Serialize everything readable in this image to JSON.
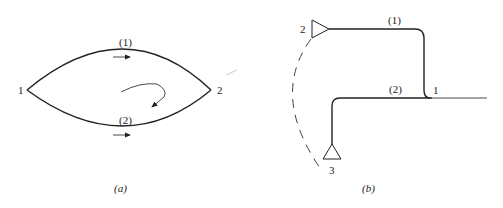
{
  "figure_a": {
    "caption": "(a)",
    "nodes": [
      {
        "id": "node-1",
        "label": "1"
      },
      {
        "id": "node-2",
        "label": "2"
      }
    ],
    "paths": [
      {
        "id": "path-1",
        "label": "(1)",
        "position": "upper arc",
        "flow_direction": "left-to-right"
      },
      {
        "id": "path-2",
        "label": "(2)",
        "position": "lower arc",
        "flow_direction": "left-to-right"
      }
    ],
    "circulation_arrow": "clockwise-curved arrow at center"
  },
  "figure_b": {
    "caption": "(b)",
    "nodes": [
      {
        "id": "node-1",
        "label": "1",
        "role": "junction"
      },
      {
        "id": "node-2",
        "label": "2",
        "role": "triangle terminal pointing right"
      },
      {
        "id": "node-3",
        "label": "3",
        "role": "triangle terminal pointing up"
      }
    ],
    "paths": [
      {
        "id": "path-1",
        "label": "(1)",
        "from": "1",
        "to": "2",
        "route": "up then left"
      },
      {
        "id": "path-2",
        "label": "(2)",
        "from": "1",
        "to": "3",
        "route": "left then down"
      }
    ],
    "dashed_link": "dashed arc connecting terminal 2 and terminal 3"
  }
}
